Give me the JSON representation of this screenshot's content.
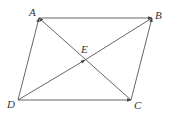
{
  "figure": {
    "type": "parallelogram-vectors",
    "colors": {
      "line": "#555555",
      "label": "#333333",
      "background": "#ffffff"
    },
    "points": {
      "A": {
        "label": "A",
        "x": 39,
        "y": 18,
        "lx": 29,
        "ly": 16
      },
      "B": {
        "label": "B",
        "x": 152,
        "y": 18,
        "lx": 155,
        "ly": 19
      },
      "C": {
        "label": "C",
        "x": 131,
        "y": 100,
        "lx": 134,
        "ly": 109
      },
      "D": {
        "label": "D",
        "x": 18,
        "y": 100,
        "lx": 7,
        "ly": 108
      },
      "E": {
        "label": "E",
        "x": 85,
        "y": 60,
        "lx": 81,
        "ly": 53
      }
    },
    "vectors": [
      {
        "from": "A",
        "to": "B",
        "name": "vector-ab"
      },
      {
        "from": "D",
        "to": "A",
        "name": "vector-da"
      },
      {
        "from": "C",
        "to": "B",
        "name": "vector-cb"
      },
      {
        "from": "D",
        "to": "C",
        "name": "vector-dc"
      },
      {
        "from": "C",
        "to": "A",
        "name": "vector-ca"
      },
      {
        "from": "D",
        "to": "E",
        "name": "vector-de"
      }
    ],
    "segments": [
      {
        "from": "E",
        "to": "B",
        "name": "segment-eb"
      }
    ]
  }
}
